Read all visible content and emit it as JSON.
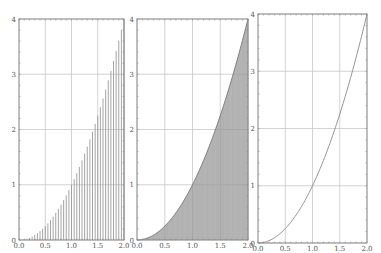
{
  "figure": {
    "caption_fragment": "",
    "colors": {
      "axis": "#8a8a8a",
      "grid": "#c8c8c8",
      "stem": "#9a9a9a",
      "fill": "#9a9a9a",
      "line": "#8a8a8a",
      "label": "#555555"
    }
  },
  "chart_data": [
    {
      "type": "bar",
      "subtype": "stem",
      "title": "",
      "function": "y = x^2",
      "x_step": 0.05,
      "x": [
        0.0,
        0.05,
        0.1,
        0.15,
        0.2,
        0.25,
        0.3,
        0.35,
        0.4,
        0.45,
        0.5,
        0.55,
        0.6,
        0.65,
        0.7,
        0.75,
        0.8,
        0.85,
        0.9,
        0.95,
        1.0,
        1.05,
        1.1,
        1.15,
        1.2,
        1.25,
        1.3,
        1.35,
        1.4,
        1.45,
        1.5,
        1.55,
        1.6,
        1.65,
        1.7,
        1.75,
        1.8,
        1.85,
        1.9,
        1.95,
        2.0
      ],
      "values": [
        0.0,
        0.0025,
        0.01,
        0.0225,
        0.04,
        0.0625,
        0.09,
        0.1225,
        0.16,
        0.2025,
        0.25,
        0.3025,
        0.36,
        0.4225,
        0.49,
        0.5625,
        0.64,
        0.7225,
        0.81,
        0.9025,
        1.0,
        1.1025,
        1.21,
        1.3225,
        1.44,
        1.5625,
        1.69,
        1.8225,
        1.96,
        2.1025,
        2.25,
        2.4025,
        2.56,
        2.7225,
        2.89,
        3.0625,
        3.24,
        3.4225,
        3.61,
        3.8025,
        4.0
      ],
      "xlabel": "",
      "ylabel": "",
      "xlim": [
        0,
        2
      ],
      "ylim": [
        0,
        4
      ],
      "xticks": [
        "0.0",
        "0.5",
        "1.0",
        "1.5",
        "2.0"
      ],
      "yticks": [
        "0",
        "1",
        "2",
        "3",
        "4"
      ],
      "grid": true
    },
    {
      "type": "area",
      "subtype": "dense-stem",
      "title": "",
      "function": "y = x^2",
      "x_step": 0.01,
      "samples": 201,
      "xlabel": "",
      "ylabel": "",
      "xlim": [
        0,
        2
      ],
      "ylim": [
        0,
        4
      ],
      "xticks": [
        "0.0",
        "0.5",
        "1.0",
        "1.5",
        "2.0"
      ],
      "yticks": [
        "0",
        "1",
        "2",
        "3",
        "4"
      ],
      "grid": true
    },
    {
      "type": "line",
      "title": "",
      "function": "y = x^2",
      "x": [
        0.0,
        0.25,
        0.5,
        0.75,
        1.0,
        1.25,
        1.5,
        1.75,
        2.0
      ],
      "values": [
        0.0,
        0.0625,
        0.25,
        0.5625,
        1.0,
        1.5625,
        2.25,
        3.0625,
        4.0
      ],
      "xlabel": "",
      "ylabel": "",
      "xlim": [
        0,
        2
      ],
      "ylim": [
        0,
        4
      ],
      "xticks": [
        "0.0",
        "0.5",
        "1.0",
        "1.5",
        "2.0"
      ],
      "yticks": [
        "0",
        "1",
        "2",
        "3",
        "4"
      ],
      "grid": true
    }
  ],
  "panels": [
    {
      "box": {
        "x0": 19,
        "x1": 124,
        "y0": 19,
        "y1": 240
      }
    },
    {
      "box": {
        "x0": 137,
        "x1": 248,
        "y0": 19,
        "y1": 240
      }
    },
    {
      "box": {
        "x0": 258,
        "x1": 367,
        "y0": 14,
        "y1": 243
      }
    }
  ]
}
